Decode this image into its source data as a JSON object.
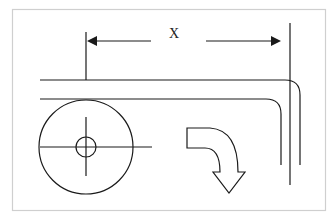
{
  "diagram": {
    "dimension_label": "X",
    "colors": {
      "line": "#1a1a1a",
      "frame": "#cfcfcf",
      "background": "#ffffff"
    },
    "elements": [
      "frame",
      "dimension-arrow-x",
      "extension-line-left",
      "extension-line-right",
      "outer-bent-path",
      "inner-bent-path",
      "wheel-circle",
      "wheel-hub-circle",
      "wheel-crosshair",
      "curved-direction-arrow"
    ]
  }
}
